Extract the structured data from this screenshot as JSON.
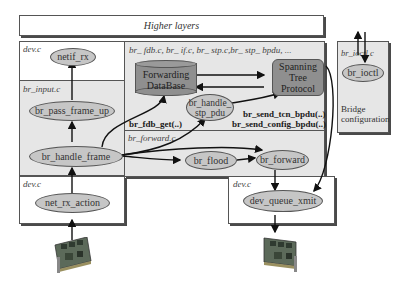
{
  "diagram": {
    "higher_layers": "Higher layers",
    "regions": {
      "dev_c_top": "dev.c",
      "br_input_c": "br_input.c",
      "br_files": "br_ fdb.c, br_ if.c, br_ stp.c,br_ stp_ bpdu, ...",
      "br_forward_c": "br_forward.c",
      "dev_c_bottom_left": "dev.c",
      "dev_c_bottom_right": "dev.c",
      "br_ioctl_c": "br_ioctl.c"
    },
    "nodes": {
      "netif_rx": "netif_rx",
      "br_pass_frame_up": "br_pass_frame_up",
      "br_handle_frame": "br_handle_frame",
      "net_rx_action": "net_rx_action",
      "forwarding_database_line1": "Forwarding",
      "forwarding_database_line2": "DataBase",
      "spanning_tree_line1": "Spanning",
      "spanning_tree_line2": "Tree",
      "spanning_tree_line3": "Protocol",
      "br_handle_stp_pdu_line1": "br_handle_",
      "br_handle_stp_pdu_line2": "stp_pdu",
      "br_flood": "br_flood",
      "br_forward": "br_forward",
      "dev_queue_xmit": "dev_queue_xmit",
      "br_ioctl": "br_ioctl"
    },
    "function_labels": {
      "br_fdb_get": "br_fdb_get(..)",
      "br_send_tcn_bpdu": "br_send_tcn_bpdu(..)",
      "br_send_config_bpdu": "br_send_config_bpdu(..)"
    },
    "bridge_config_line1": "Bridge",
    "bridge_config_line2": "configuration",
    "icons": {
      "nic_left": "network-card-icon",
      "nic_right": "network-card-icon"
    },
    "colors": {
      "ellipse_fill": "#c6c6c6",
      "db_fill": "#8f8f8f",
      "panel_gray": "#e6e6e6",
      "border": "#555555"
    }
  }
}
